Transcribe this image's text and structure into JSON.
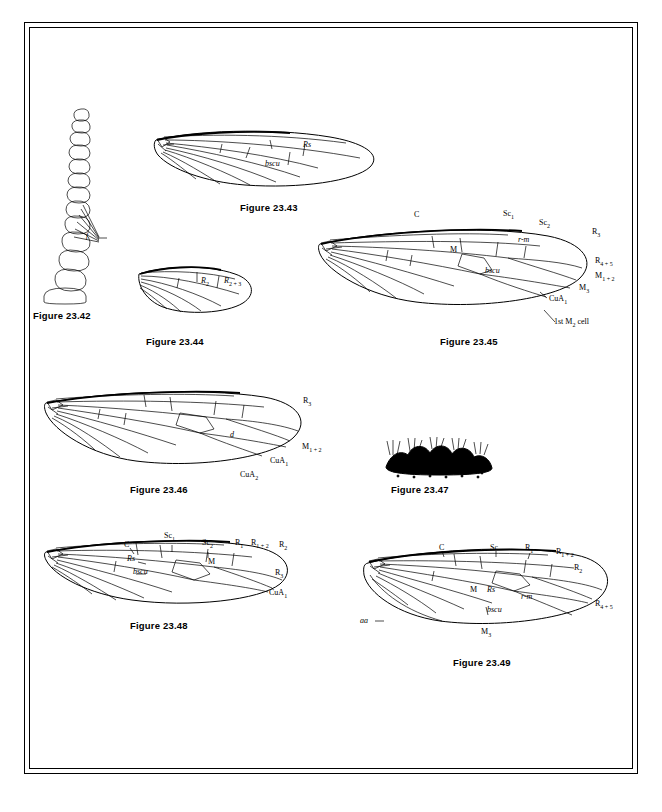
{
  "page": {
    "background": "#ffffff",
    "frame_color": "#000000"
  },
  "figures": [
    {
      "id": "fig-23-42",
      "caption": "Figure 23.42",
      "caption_pos": {
        "x": 33,
        "y": 316
      },
      "type": "antenna-segments-lateral",
      "labels": [
        {
          "text": "f",
          "x": 88,
          "y": 237,
          "italic": true
        }
      ]
    },
    {
      "id": "fig-23-43",
      "caption": "Figure 23.43",
      "caption_pos": {
        "x": 240,
        "y": 207
      },
      "type": "insect-wing-venation",
      "labels": [
        {
          "text": "Rs",
          "x": 305,
          "y": 146,
          "italic": true
        },
        {
          "text": "bscu",
          "x": 268,
          "y": 164,
          "italic": true
        }
      ]
    },
    {
      "id": "fig-23-44",
      "caption": "Figure 23.44",
      "caption_pos": {
        "x": 146,
        "y": 341
      },
      "type": "insect-wing-venation",
      "labels": [
        {
          "text": "R2",
          "x": 203,
          "y": 281,
          "italic": true
        },
        {
          "text": "R2+3",
          "x": 228,
          "y": 281,
          "italic": true
        }
      ]
    },
    {
      "id": "fig-23-45",
      "caption": "Figure 23.45",
      "caption_pos": {
        "x": 440,
        "y": 341
      },
      "type": "insect-wing-venation",
      "labels": [
        {
          "text": "C",
          "x": 415,
          "y": 215,
          "italic": false
        },
        {
          "text": "Sc1",
          "x": 505,
          "y": 214,
          "italic": false
        },
        {
          "text": "Sc2",
          "x": 541,
          "y": 222,
          "italic": false
        },
        {
          "text": "R3",
          "x": 593,
          "y": 232,
          "italic": false
        },
        {
          "text": "M",
          "x": 451,
          "y": 249,
          "italic": false
        },
        {
          "text": "r-m",
          "x": 520,
          "y": 240,
          "italic": true
        },
        {
          "text": "R4+5",
          "x": 597,
          "y": 261,
          "italic": false
        },
        {
          "text": "bscu",
          "x": 487,
          "y": 270,
          "italic": true
        },
        {
          "text": "M1+2",
          "x": 597,
          "y": 276,
          "italic": false
        },
        {
          "text": "M3",
          "x": 581,
          "y": 288,
          "italic": false
        },
        {
          "text": "CuA1",
          "x": 551,
          "y": 299,
          "italic": false
        },
        {
          "text": "1st M2 cell",
          "x": 556,
          "y": 322,
          "italic": false
        }
      ]
    },
    {
      "id": "fig-23-46",
      "caption": "Figure 23.46",
      "caption_pos": {
        "x": 130,
        "y": 489
      },
      "type": "insect-wing-venation",
      "labels": [
        {
          "text": "R3",
          "x": 305,
          "y": 401,
          "italic": false
        },
        {
          "text": "d",
          "x": 232,
          "y": 436,
          "italic": true
        },
        {
          "text": "M1+2",
          "x": 304,
          "y": 447,
          "italic": false
        },
        {
          "text": "CuA1",
          "x": 272,
          "y": 461,
          "italic": false
        },
        {
          "text": "CuA2",
          "x": 242,
          "y": 475,
          "italic": false
        }
      ]
    },
    {
      "id": "fig-23-47",
      "caption": "Figure 23.47",
      "caption_pos": {
        "x": 391,
        "y": 489
      },
      "type": "larva-dorsal-setae-row",
      "labels": []
    },
    {
      "id": "fig-23-48",
      "caption": "Figure 23.48",
      "caption_pos": {
        "x": 130,
        "y": 625
      },
      "type": "insect-wing-venation",
      "labels": [
        {
          "text": "C",
          "x": 125,
          "y": 545,
          "italic": false
        },
        {
          "text": "Sc1",
          "x": 166,
          "y": 536,
          "italic": false
        },
        {
          "text": "Sc2",
          "x": 204,
          "y": 543,
          "italic": false
        },
        {
          "text": "R1",
          "x": 237,
          "y": 543,
          "italic": false
        },
        {
          "text": "R1+2",
          "x": 253,
          "y": 543,
          "italic": false
        },
        {
          "text": "R2",
          "x": 281,
          "y": 545,
          "italic": false
        },
        {
          "text": "Rs",
          "x": 129,
          "y": 559,
          "italic": true
        },
        {
          "text": "M",
          "x": 210,
          "y": 562,
          "italic": false
        },
        {
          "text": "bscu",
          "x": 135,
          "y": 572,
          "italic": true
        },
        {
          "text": "R3",
          "x": 277,
          "y": 573,
          "italic": false
        },
        {
          "text": "CuA1",
          "x": 271,
          "y": 593,
          "italic": false
        }
      ]
    },
    {
      "id": "fig-23-49",
      "caption": "Figure 23.49",
      "caption_pos": {
        "x": 453,
        "y": 662
      },
      "type": "insect-wing-venation",
      "labels": [
        {
          "text": "C",
          "x": 440,
          "y": 548,
          "italic": false
        },
        {
          "text": "Sc",
          "x": 492,
          "y": 548,
          "italic": false
        },
        {
          "text": "R1",
          "x": 527,
          "y": 548,
          "italic": false
        },
        {
          "text": "R1+2",
          "x": 558,
          "y": 552,
          "italic": false
        },
        {
          "text": "R2",
          "x": 576,
          "y": 568,
          "italic": false
        },
        {
          "text": "M",
          "x": 471,
          "y": 590,
          "italic": false
        },
        {
          "text": "Rs",
          "x": 489,
          "y": 590,
          "italic": true
        },
        {
          "text": "r-m",
          "x": 523,
          "y": 597,
          "italic": true
        },
        {
          "text": "bscu",
          "x": 489,
          "y": 610,
          "italic": true
        },
        {
          "text": "R4+5",
          "x": 597,
          "y": 604,
          "italic": false
        },
        {
          "text": "aa",
          "x": 362,
          "y": 621,
          "italic": true
        },
        {
          "text": "M3",
          "x": 483,
          "y": 632,
          "italic": false
        }
      ]
    }
  ]
}
